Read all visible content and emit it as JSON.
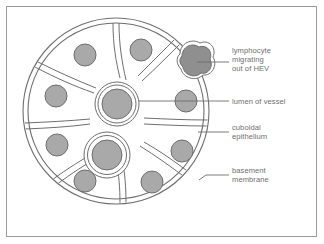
{
  "figure": {
    "type": "biological-diagram",
    "background_color": "#ffffff",
    "frame_color": "#9a9a9a",
    "line_color": "#6e6e6e",
    "nucleus_fill": "#a9a9a9",
    "lymphocyte_fill": "#8f8f8f",
    "lumen_fill": "#a9a9a9",
    "label_color": "#6e6e6e"
  },
  "labels": [
    {
      "id": "lymphocyte",
      "text": "lymphocyte\nmigrating\nout of HEV",
      "points_to": "lymphocyte-cell",
      "leader_y": 62
    },
    {
      "id": "lumen",
      "text": "lumen of vessel",
      "points_to": "upper-lumen",
      "leader_y": 101
    },
    {
      "id": "cuboidal",
      "text": "cuboidal\nepithelium",
      "points_to": "epithelial-cell",
      "leader_y": 132
    },
    {
      "id": "basement",
      "text": "basement\nmembrane",
      "points_to": "basement-membrane-ring",
      "leader_y": 175
    }
  ],
  "structures": {
    "outer_circle": {
      "cx": 116,
      "cy": 111,
      "r": 93
    },
    "basement_membrane_inner_r": 88,
    "lumens": [
      {
        "id": "upper-lumen",
        "cx": 117,
        "cy": 104,
        "r_nucleus": 15,
        "r_ring1": 19,
        "r_ring2": 22
      },
      {
        "id": "lower-lumen",
        "cx": 107,
        "cy": 155,
        "r_nucleus": 15,
        "r_ring1": 19,
        "r_ring2": 23
      }
    ],
    "nuclei": [
      {
        "cx": 85,
        "cy": 55,
        "r": 11
      },
      {
        "cx": 141,
        "cy": 50,
        "r": 11
      },
      {
        "cx": 56,
        "cy": 96,
        "r": 11
      },
      {
        "cx": 57,
        "cy": 145,
        "r": 11
      },
      {
        "cx": 85,
        "cy": 181,
        "r": 11
      },
      {
        "cx": 152,
        "cy": 182,
        "r": 11
      },
      {
        "cx": 182,
        "cy": 151,
        "r": 11
      },
      {
        "cx": 186,
        "cy": 101,
        "r": 11
      }
    ],
    "lymphocyte": {
      "cx": 194,
      "cy": 63,
      "r": 14
    }
  }
}
